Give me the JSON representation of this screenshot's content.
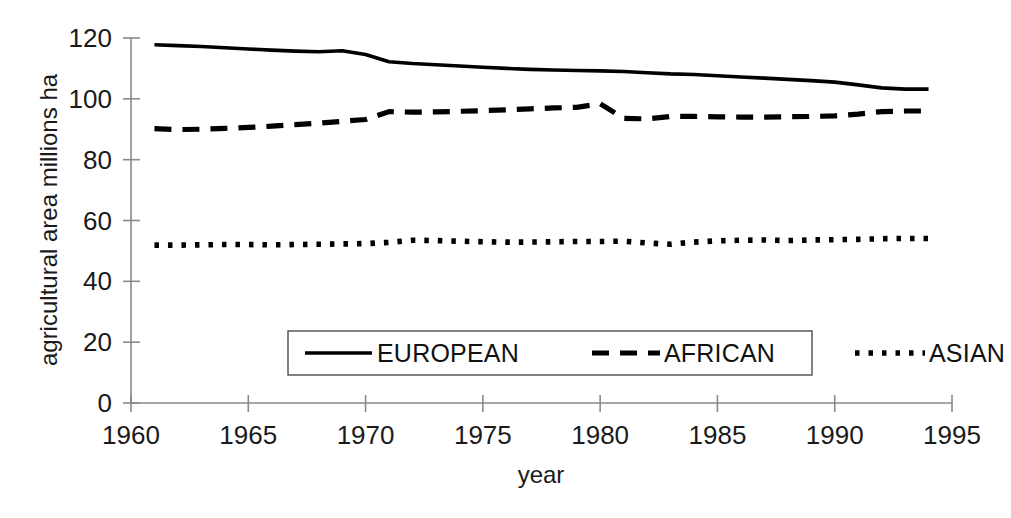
{
  "chart_data": {
    "type": "line",
    "title": "",
    "xlabel": "year",
    "ylabel": "agricultural area  millions ha",
    "xlim": [
      1960,
      1995
    ],
    "ylim": [
      0,
      120
    ],
    "xticks": [
      1960,
      1965,
      1970,
      1975,
      1980,
      1985,
      1990,
      1995
    ],
    "yticks": [
      0,
      20,
      40,
      60,
      80,
      100,
      120
    ],
    "grid": false,
    "legend_position": "lower-center-inside",
    "x": [
      1961,
      1962,
      1963,
      1964,
      1965,
      1966,
      1967,
      1968,
      1969,
      1970,
      1971,
      1972,
      1973,
      1974,
      1975,
      1976,
      1977,
      1978,
      1979,
      1980,
      1981,
      1982,
      1983,
      1984,
      1985,
      1986,
      1987,
      1988,
      1989,
      1990,
      1991,
      1992,
      1993,
      1994
    ],
    "series": [
      {
        "name": "EUROPEAN",
        "style": "solid",
        "color": "#000000",
        "values": [
          117.8,
          117.5,
          117.2,
          116.8,
          116.4,
          116.0,
          115.7,
          115.5,
          115.8,
          114.6,
          112.2,
          111.6,
          111.2,
          110.8,
          110.4,
          110.0,
          109.7,
          109.5,
          109.3,
          109.2,
          109.0,
          108.6,
          108.2,
          108.0,
          107.6,
          107.2,
          106.8,
          106.4,
          106.0,
          105.5,
          104.6,
          103.6,
          103.2,
          103.2
        ]
      },
      {
        "name": "AFRICAN",
        "style": "dashed",
        "color": "#000000",
        "values": [
          90.2,
          89.9,
          90.0,
          90.3,
          90.6,
          91.0,
          91.5,
          92.0,
          92.6,
          93.2,
          95.8,
          95.6,
          95.7,
          95.9,
          96.1,
          96.4,
          96.7,
          97.0,
          97.2,
          98.4,
          93.6,
          93.4,
          94.2,
          94.2,
          94.1,
          94.0,
          94.0,
          94.1,
          94.2,
          94.4,
          95.0,
          95.8,
          96.0,
          96.0
        ]
      },
      {
        "name": "ASIAN",
        "style": "dotted",
        "color": "#000000",
        "values": [
          51.9,
          51.9,
          52.0,
          52.1,
          52.1,
          52.0,
          52.1,
          52.2,
          52.3,
          52.4,
          52.8,
          53.5,
          53.4,
          53.2,
          53.0,
          52.9,
          52.9,
          53.0,
          53.1,
          53.1,
          53.2,
          52.6,
          52.2,
          52.9,
          53.3,
          53.5,
          53.6,
          53.4,
          53.6,
          53.7,
          53.8,
          54.0,
          54.1,
          54.1
        ]
      }
    ]
  },
  "axes": {
    "y_title": "agricultural area  millions ha",
    "x_title": "year",
    "y_tick_labels": [
      "120",
      "100",
      "80",
      "60",
      "40",
      "20",
      "0"
    ],
    "x_tick_labels": [
      "1960",
      "1965",
      "1970",
      "1975",
      "1980",
      "1985",
      "1990",
      "1995"
    ]
  },
  "legend": {
    "items": [
      {
        "label": "EUROPEAN",
        "style": "solid"
      },
      {
        "label": "AFRICAN",
        "style": "dashed"
      },
      {
        "label": "ASIAN",
        "style": "dotted"
      }
    ]
  }
}
